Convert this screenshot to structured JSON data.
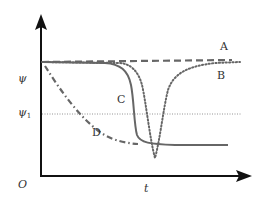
{
  "diagram": {
    "axes": {
      "y_label": "ψ",
      "y1_label": "ψ",
      "y1_subscript": "1",
      "origin_label": "O",
      "x_label": "t"
    },
    "curves": [
      {
        "id": "A",
        "label": "A",
        "style": "dashed",
        "description": "stays near initial level ψ"
      },
      {
        "id": "B",
        "label": "B",
        "style": "dotted",
        "description": "dips sharply below ψ1 then recovers to ψ"
      },
      {
        "id": "C",
        "label": "C",
        "style": "solid",
        "description": "stays near ψ then drops steeply below ψ1 and levels off"
      },
      {
        "id": "D",
        "label": "D",
        "style": "dash-dot",
        "description": "decreases gradually from ψ below ψ1 and merges with C"
      }
    ],
    "reference_line": {
      "label": "ψ1",
      "style": "dotted"
    },
    "colors": {
      "axis": "#111111",
      "curve": "#666666",
      "text": "#333333"
    }
  }
}
